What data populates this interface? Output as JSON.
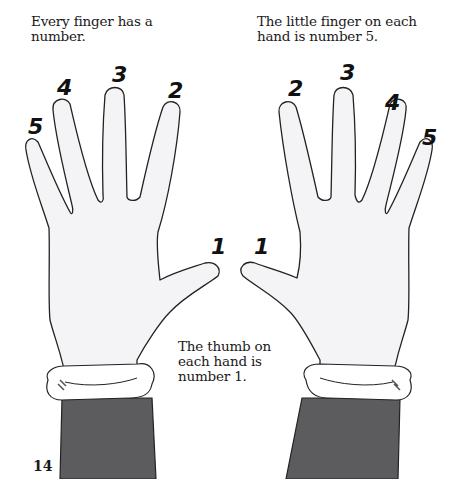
{
  "captions": {
    "top_left": "Every finger has a number.",
    "top_right": "The little finger on each hand is number 5.",
    "middle": "The thumb on each hand is number 1."
  },
  "page_number": "14",
  "left_hand": {
    "finger_labels": [
      "5",
      "4",
      "3",
      "2",
      "1"
    ]
  },
  "right_hand": {
    "finger_labels": [
      "1",
      "2",
      "3",
      "4",
      "5"
    ]
  },
  "colors": {
    "glove": "#f4f4f6",
    "outline": "#222222",
    "sleeve": "#5c5c5e",
    "cuff": "#ffffff"
  }
}
